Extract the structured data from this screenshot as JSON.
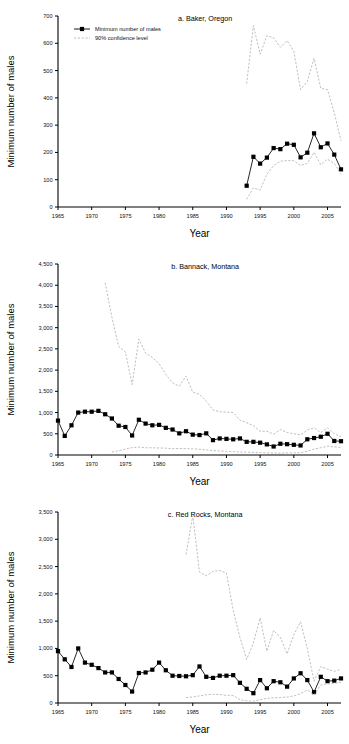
{
  "figure": {
    "name": "three-panel-time-series",
    "xlabel": "Year",
    "ylabel": "Minimum number of males",
    "legend": {
      "series1": "Minimum number of males",
      "series2": "90% confidence level"
    },
    "colors": {
      "series1": "#000000",
      "series2": "#aaaaaa",
      "axis": "#000000"
    }
  },
  "chart_data": [
    {
      "type": "line",
      "panel": "a",
      "title": "a. Baker, Oregon",
      "xlabel": "Year",
      "ylabel": "Minimum number of males",
      "xlim": [
        1965,
        2007
      ],
      "ylim": [
        0,
        700
      ],
      "yticks": [
        0,
        100,
        200,
        300,
        400,
        500,
        600,
        700
      ],
      "ytick_labels": [
        "0",
        "100",
        "200",
        "300",
        "400",
        "500",
        "600",
        "700"
      ],
      "xticks": [
        1965,
        1970,
        1975,
        1980,
        1985,
        1990,
        1995,
        2000,
        2005
      ],
      "xtick_labels": [
        "1965",
        "1970",
        "1975",
        "1980",
        "1985",
        "1990",
        "1995",
        "2000",
        "2005"
      ],
      "grid": false,
      "legend_position": "top-left",
      "series": [
        {
          "name": "Minimum number of males",
          "marker": "filled-square",
          "style": "solid",
          "x": [
            1993,
            1994,
            1995,
            1996,
            1997,
            1998,
            1999,
            2000,
            2001,
            2002,
            2003,
            2004,
            2005,
            2006,
            2007
          ],
          "values": [
            78,
            184,
            159,
            181,
            216,
            212,
            232,
            228,
            182,
            199,
            270,
            219,
            233,
            192,
            138
          ]
        },
        {
          "name": "90% confidence level upper",
          "marker": "none",
          "style": "dashed",
          "x": [
            1993,
            1994,
            1995,
            1996,
            1997,
            1998,
            1999,
            2000,
            2001,
            2002,
            2003,
            2004,
            2005,
            2006,
            2007
          ],
          "values": [
            452,
            665,
            560,
            628,
            620,
            585,
            610,
            570,
            430,
            460,
            545,
            435,
            430,
            345,
            243
          ]
        },
        {
          "name": "90% confidence level lower",
          "marker": "none",
          "style": "dashed",
          "x": [
            1993,
            1994,
            1995,
            1996,
            1997,
            1998,
            1999,
            2000,
            2001,
            2002,
            2003,
            2004,
            2005,
            2006,
            2007
          ],
          "values": [
            28,
            70,
            62,
            120,
            152,
            168,
            170,
            170,
            152,
            160,
            200,
            155,
            175,
            160,
            120
          ]
        }
      ]
    },
    {
      "type": "line",
      "panel": "b",
      "title": "b. Bannack, Montana",
      "xlabel": "Year",
      "ylabel": "Minimum number of males",
      "xlim": [
        1965,
        2007
      ],
      "ylim": [
        0,
        4500
      ],
      "yticks": [
        0,
        500,
        1000,
        1500,
        2000,
        2500,
        3000,
        3500,
        4000,
        4500
      ],
      "ytick_labels": [
        "0",
        "500",
        "1,000",
        "1,500",
        "2,000",
        "2,500",
        "3,000",
        "3,500",
        "4,000",
        "4,500"
      ],
      "xticks": [
        1965,
        1970,
        1975,
        1980,
        1985,
        1990,
        1995,
        2000,
        2005
      ],
      "xtick_labels": [
        "1965",
        "1970",
        "1975",
        "1980",
        "1985",
        "1990",
        "1995",
        "2000",
        "2005"
      ],
      "grid": false,
      "legend_position": "none",
      "series": [
        {
          "name": "Minimum number of males",
          "marker": "filled-square",
          "style": "solid",
          "x": [
            1965,
            1966,
            1967,
            1968,
            1969,
            1970,
            1971,
            1972,
            1973,
            1974,
            1975,
            1976,
            1977,
            1978,
            1979,
            1980,
            1981,
            1982,
            1983,
            1984,
            1985,
            1986,
            1987,
            1988,
            1989,
            1990,
            1991,
            1992,
            1993,
            1994,
            1995,
            1996,
            1997,
            1998,
            1999,
            2000,
            2001,
            2002,
            2003,
            2004,
            2005,
            2006,
            2007
          ],
          "values": [
            810,
            450,
            700,
            1000,
            1020,
            1020,
            1040,
            960,
            860,
            690,
            660,
            460,
            830,
            740,
            700,
            710,
            640,
            600,
            510,
            560,
            480,
            470,
            510,
            350,
            390,
            380,
            370,
            390,
            310,
            310,
            290,
            250,
            200,
            265,
            255,
            240,
            225,
            370,
            400,
            430,
            500,
            330,
            325
          ]
        },
        {
          "name": "90% confidence level upper",
          "marker": "none",
          "style": "dashed",
          "x": [
            1972,
            1973,
            1974,
            1975,
            1976,
            1977,
            1978,
            1979,
            1980,
            1981,
            1982,
            1983,
            1984,
            1985,
            1986,
            1987,
            1988,
            1989,
            1990,
            1991,
            1992,
            1993,
            1994,
            1995,
            1996,
            1997,
            1998,
            1999,
            2000,
            2001,
            2002,
            2003,
            2004,
            2005,
            2006,
            2007
          ],
          "values": [
            4060,
            3250,
            2560,
            2430,
            1660,
            2730,
            2400,
            2300,
            2150,
            1900,
            1700,
            1620,
            1860,
            1480,
            1430,
            1270,
            1060,
            1020,
            1010,
            1000,
            820,
            760,
            690,
            560,
            560,
            490,
            600,
            530,
            500,
            475,
            590,
            640,
            530,
            640,
            500,
            430
          ]
        },
        {
          "name": "90% confidence level lower",
          "marker": "none",
          "style": "dashed",
          "x": [
            1973,
            1974,
            1975,
            1976,
            1977,
            1978,
            1979,
            1980,
            1981,
            1982,
            1983,
            1984,
            1985,
            1986,
            1987,
            1988,
            1989,
            1990,
            1991,
            1992,
            1993,
            1994,
            1995,
            1996,
            1997,
            1998,
            1999,
            2000,
            2001,
            2002,
            2003,
            2004,
            2005,
            2006,
            2007
          ],
          "values": [
            70,
            100,
            140,
            175,
            185,
            170,
            170,
            165,
            160,
            150,
            155,
            150,
            145,
            135,
            120,
            105,
            95,
            85,
            80,
            70,
            65,
            60,
            55,
            50,
            45,
            45,
            50,
            50,
            55,
            90,
            140,
            170,
            210,
            190,
            180
          ]
        }
      ]
    },
    {
      "type": "line",
      "panel": "c",
      "title": "c. Red Rocks, Montana",
      "xlabel": "Year",
      "ylabel": "Minimum number of males",
      "xlim": [
        1965,
        2007
      ],
      "ylim": [
        0,
        3500
      ],
      "yticks": [
        0,
        500,
        1000,
        1500,
        2000,
        2500,
        3000,
        3500
      ],
      "ytick_labels": [
        "0",
        "500",
        "1,000",
        "1,500",
        "2,000",
        "2,500",
        "3,000",
        "3,500"
      ],
      "xticks": [
        1965,
        1970,
        1975,
        1980,
        1985,
        1990,
        1995,
        2000,
        2005
      ],
      "xtick_labels": [
        "1965",
        "1970",
        "1975",
        "1980",
        "1985",
        "1990",
        "1995",
        "2000",
        "2005"
      ],
      "grid": false,
      "legend_position": "none",
      "series": [
        {
          "name": "Minimum number of males",
          "marker": "filled-square",
          "style": "solid",
          "x": [
            1965,
            1966,
            1967,
            1968,
            1969,
            1970,
            1971,
            1972,
            1973,
            1974,
            1975,
            1976,
            1977,
            1978,
            1979,
            1980,
            1981,
            1982,
            1983,
            1984,
            1985,
            1986,
            1987,
            1988,
            1989,
            1990,
            1991,
            1992,
            1993,
            1994,
            1995,
            1996,
            1997,
            1998,
            1999,
            2000,
            2001,
            2002,
            2003,
            2004,
            2005,
            2006,
            2007
          ],
          "values": [
            950,
            800,
            660,
            1000,
            740,
            700,
            640,
            560,
            560,
            440,
            330,
            210,
            550,
            560,
            610,
            740,
            600,
            500,
            495,
            490,
            510,
            670,
            480,
            460,
            500,
            500,
            510,
            370,
            260,
            180,
            420,
            270,
            400,
            380,
            300,
            450,
            545,
            420,
            200,
            480,
            400,
            410,
            450
          ]
        },
        {
          "name": "90% confidence level upper",
          "marker": "none",
          "style": "dashed",
          "x": [
            1984,
            1985,
            1986,
            1987,
            1988,
            1989,
            1990,
            1991,
            1992,
            1993,
            1994,
            1995,
            1996,
            1997,
            1998,
            1999,
            2000,
            2001,
            2002,
            2003,
            2004,
            2005,
            2006,
            2007
          ],
          "values": [
            2720,
            3430,
            2400,
            2330,
            2410,
            2430,
            2380,
            1700,
            1200,
            800,
            1100,
            1560,
            950,
            1330,
            1200,
            900,
            1250,
            1490,
            1000,
            400,
            670,
            620,
            580,
            620
          ]
        },
        {
          "name": "90% confidence level lower",
          "marker": "none",
          "style": "dashed",
          "x": [
            1984,
            1985,
            1986,
            1987,
            1988,
            1989,
            1990,
            1991,
            1992,
            1993,
            1994,
            1995,
            1996,
            1997,
            1998,
            1999,
            2000,
            2001,
            2002,
            2003,
            2004,
            2005,
            2006,
            2007
          ],
          "values": [
            100,
            110,
            130,
            150,
            160,
            155,
            140,
            140,
            60,
            40,
            35,
            60,
            85,
            95,
            100,
            110,
            130,
            170,
            240,
            150,
            330,
            350,
            360,
            380
          ]
        }
      ]
    }
  ]
}
